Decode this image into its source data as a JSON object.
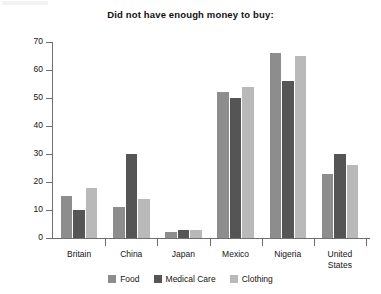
{
  "chart_data": {
    "type": "bar",
    "title": "Did not have enough money to buy:",
    "xlabel": "",
    "ylabel": "",
    "ylim": [
      0,
      70
    ],
    "yticks": [
      0,
      10,
      20,
      30,
      40,
      50,
      60,
      70
    ],
    "grid": false,
    "legend_position": "bottom",
    "categories": [
      "Britain",
      "China",
      "Japan",
      "Mexico",
      "Nigeria",
      "United States"
    ],
    "category_labels": [
      "Britain",
      "China",
      "Japan",
      "Mexico",
      "Nigeria",
      "United\nStates"
    ],
    "series": [
      {
        "name": "Food",
        "color": "#8d8d8d",
        "values": [
          15,
          11,
          2,
          52,
          66,
          23
        ]
      },
      {
        "name": "Medical Care",
        "color": "#555555",
        "values": [
          10,
          30,
          3,
          50,
          56,
          30
        ]
      },
      {
        "name": "Clothing",
        "color": "#b9b9b9",
        "values": [
          18,
          14,
          3,
          54,
          65,
          26
        ]
      }
    ]
  },
  "colors": {
    "food": "#8d8d8d",
    "medical": "#555555",
    "clothing": "#b9b9b9",
    "axis": "#6f6f6f",
    "text": "#141414",
    "background": "#ffffff"
  }
}
